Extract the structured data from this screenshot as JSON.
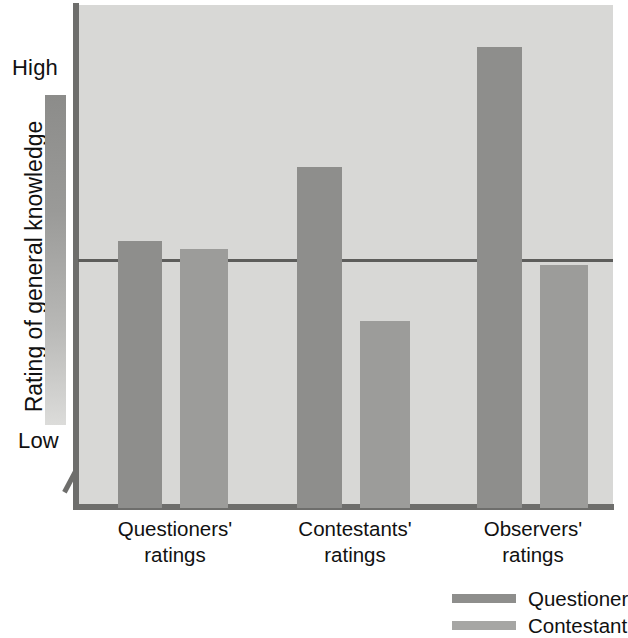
{
  "chart_data": {
    "type": "bar",
    "title": "",
    "subtitle": "",
    "xlabel": "",
    "ylabel": "Rating of general knowledge",
    "categories": [
      "Questioners' ratings",
      "Contestants' ratings",
      "Observers' ratings"
    ],
    "category_lines": [
      [
        "Questioners'",
        "ratings"
      ],
      [
        "Contestants'",
        "ratings"
      ],
      [
        "Observers'",
        "ratings"
      ]
    ],
    "series": [
      {
        "name": "Questioner",
        "color": "#8e8e8c",
        "values": [
          53.5,
          68.0,
          92.0
        ]
      },
      {
        "name": "Contestant",
        "color": "#a6a6a4",
        "values": [
          51.8,
          37.5,
          48.5
        ]
      }
    ],
    "y_axis": {
      "tick_labels": [
        "High",
        "Low"
      ],
      "high_label": "High",
      "low_label": "Low",
      "range_low": 0,
      "range_high": 100,
      "has_axis_break": true,
      "gradient_key": {
        "top_color": "#8c8c8a",
        "bottom_color": "#dcdcda"
      }
    },
    "reference_line": {
      "value": 50.5,
      "color": "#5d5d5b"
    },
    "grid": false,
    "legend_position": "bottom-right",
    "plot_background": "#d8d8d6",
    "bar_geometry": [
      {
        "series": "Questioner",
        "group": "Questioners' ratings",
        "left": 118,
        "width": 44,
        "top": 241
      },
      {
        "series": "Contestant",
        "group": "Questioners' ratings",
        "left": 180,
        "width": 48,
        "top": 249
      },
      {
        "series": "Questioner",
        "group": "Contestants' ratings",
        "left": 297,
        "width": 45,
        "top": 167
      },
      {
        "series": "Contestant",
        "group": "Contestants' ratings",
        "left": 360,
        "width": 50,
        "top": 321
      },
      {
        "series": "Questioner",
        "group": "Observers' ratings",
        "left": 477,
        "width": 45,
        "top": 47
      },
      {
        "series": "Contestant",
        "group": "Observers' ratings",
        "left": 540,
        "width": 48,
        "top": 265
      }
    ],
    "group_label_geometry": [
      {
        "left": 110,
        "top": 516,
        "width": 130
      },
      {
        "left": 285,
        "top": 516,
        "width": 140
      },
      {
        "left": 468,
        "top": 516,
        "width": 130
      }
    ]
  },
  "legend": {
    "items": [
      {
        "label": "Questioner",
        "color": "#8e8e8c"
      },
      {
        "label": "Contestant",
        "color": "#a6a6a4"
      }
    ]
  },
  "axis": {
    "y_title": "Rating of general knowledge",
    "high": "High",
    "low": "Low"
  }
}
